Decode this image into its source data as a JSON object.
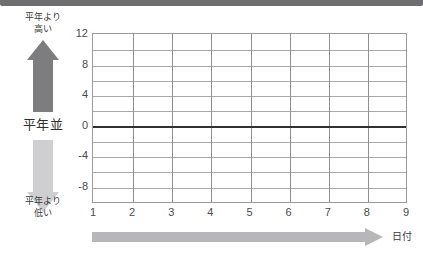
{
  "top_band": {
    "color": "#6e6e70"
  },
  "legend": {
    "high_label": "平年より\n高い",
    "high_label_line1": "平年より",
    "high_label_line2": "高い",
    "normal_label": "平年並",
    "low_label_line1": "平年より",
    "low_label_line2": "低い",
    "arrow_up_color": "#7d7d80",
    "arrow_down_color": "#cfcfd1"
  },
  "x_axis_arrow": {
    "color": "#b7b7b9",
    "title": "日付"
  },
  "chart_data": {
    "type": "line",
    "title": "",
    "subtitle": "",
    "xlabel": "日付",
    "ylabel": "",
    "x": [
      1,
      2,
      3,
      4,
      5,
      6,
      7,
      8,
      9
    ],
    "xtick_labels": [
      "1",
      "2",
      "3",
      "4",
      "5",
      "6",
      "7",
      "8",
      "9"
    ],
    "xlim": [
      1,
      9
    ],
    "ylim": [
      -10,
      12
    ],
    "ytick_labels": [
      "12",
      "8",
      "4",
      "0",
      "-4",
      "-8"
    ],
    "ytick_values": [
      12,
      8,
      4,
      0,
      -4,
      -8
    ],
    "gridline_values": [
      12,
      10,
      8,
      6,
      4,
      2,
      0,
      -2,
      -4,
      -6,
      -8,
      -10
    ],
    "grid": true,
    "legend_position": "left",
    "series": [
      {
        "name": "平年差",
        "values": [
          0,
          0,
          0,
          0,
          0,
          0,
          0,
          0,
          0
        ],
        "color": "#303032",
        "linewidth": 2
      }
    ],
    "annotations": [
      {
        "text": "平年より高い",
        "position": "left-top"
      },
      {
        "text": "平年並",
        "position": "left-middle"
      },
      {
        "text": "平年より低い",
        "position": "left-bottom"
      }
    ]
  }
}
